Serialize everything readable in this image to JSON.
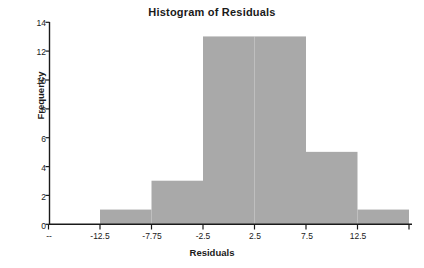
{
  "chart_data": {
    "type": "bar",
    "title": "Histogram of Residuals",
    "xlabel": "Residuals",
    "ylabel": "Frequency",
    "categories": [
      "-12.5",
      "-7.75",
      "-2.5",
      "2.5",
      "7.5",
      "12.5"
    ],
    "bin_edges": [
      -14.875,
      -10.125,
      -5.375,
      -0.625,
      4.125,
      8.875,
      13.625
    ],
    "values": [
      1,
      3,
      13,
      13,
      5,
      1
    ],
    "xlim": [
      -17.25,
      16.0
    ],
    "ylim": [
      0,
      14
    ],
    "x_ticks": [
      "--",
      "-12.5",
      "-7.75",
      "-2.5",
      "2.5",
      "7.5",
      "12.5"
    ],
    "y_ticks": [
      "0",
      "2",
      "4",
      "6",
      "8",
      "10",
      "12",
      "14"
    ],
    "grid": false,
    "legend": null,
    "bar_color": "#a9a9a9",
    "axis_color": "#1a1a1a"
  },
  "axis": {
    "y_ticks": [
      {
        "label": "14",
        "value": 14
      },
      {
        "label": "12",
        "value": 12
      },
      {
        "label": "10",
        "value": 10
      },
      {
        "label": "8",
        "value": 8
      },
      {
        "label": "6",
        "value": 6
      },
      {
        "label": "4",
        "value": 4
      },
      {
        "label": "2",
        "value": 2
      },
      {
        "label": "0",
        "value": 0
      }
    ],
    "x_ticks": [
      {
        "label": "--",
        "pos": 0
      },
      {
        "label": "-12.5",
        "pos": 1
      },
      {
        "label": "-7.75",
        "pos": 2
      },
      {
        "label": "-2.5",
        "pos": 3
      },
      {
        "label": "2.5",
        "pos": 4
      },
      {
        "label": "7.5",
        "pos": 5
      },
      {
        "label": "12.5",
        "pos": 6
      }
    ]
  }
}
